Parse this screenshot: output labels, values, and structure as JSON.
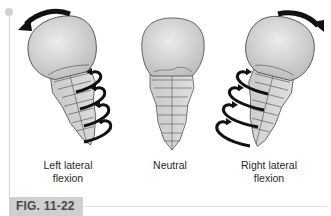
{
  "figure": {
    "label": "FIG. 11-22",
    "panels": [
      {
        "id": "left",
        "caption_line1": "Left lateral",
        "caption_line2": "flexion",
        "head_rotation_arrow": "counterclockwise",
        "spine_arrows": 4
      },
      {
        "id": "neutral",
        "caption_line1": "Neutral",
        "caption_line2": ""
      },
      {
        "id": "right",
        "caption_line1": "Right lateral",
        "caption_line2": "flexion",
        "head_rotation_arrow": "clockwise",
        "spine_arrows": 4
      }
    ]
  },
  "colors": {
    "bone_fill": "#d6d6d6",
    "bone_stroke": "#555555",
    "arrow": "#111111",
    "label_bg": "#cfcfcf",
    "label_text": "#4a4a4a",
    "caption_text": "#2a2a2a"
  }
}
